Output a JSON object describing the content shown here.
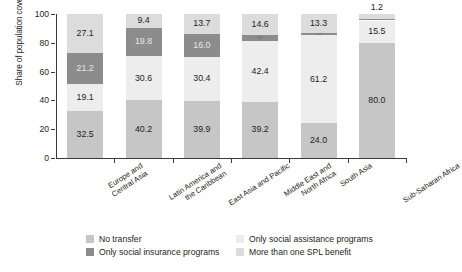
{
  "chart_data": {
    "type": "bar",
    "subtype": "stacked-bar-100",
    "title": "",
    "xlabel": "",
    "ylabel": "Share of population covered (%)",
    "ylim": [
      0,
      100
    ],
    "yticks": [
      0,
      20,
      40,
      60,
      80,
      100
    ],
    "grid": false,
    "legend_position": "bottom",
    "categories": [
      "Europe and\nCentral Asia",
      "Latin America and\nthe Caribbean",
      "East Asia and Pacific",
      "Middle East and\nNorth Africa",
      "South Asia",
      "Sub-Saharan Africa"
    ],
    "category_lines": [
      [
        "Europe and",
        "Central Asia"
      ],
      [
        "Latin America and",
        "the Caribbean"
      ],
      [
        "East Asia and Pacific"
      ],
      [
        "Middle East and",
        "North Africa"
      ],
      [
        "South Asia"
      ],
      [
        "Sub-Saharan Africa"
      ]
    ],
    "series": [
      {
        "name": "No transfer",
        "color": "#c6c6c6",
        "label_color": "dark",
        "values": [
          32.5,
          40.2,
          39.9,
          39.2,
          24.0,
          80.0
        ]
      },
      {
        "name": "Only social assistance programs",
        "color": "#ededed",
        "label_color": "dark",
        "values": [
          19.1,
          30.6,
          30.4,
          42.4,
          61.2,
          15.5
        ]
      },
      {
        "name": "Only social insurance programs",
        "color": "#8c8c8c",
        "label_color": "light",
        "values": [
          21.2,
          19.8,
          16.0,
          3.8,
          1.5,
          1.2
        ]
      },
      {
        "name": "More than one SPL benefit",
        "color": "#dcdcdc",
        "label_color": "dark",
        "values": [
          27.1,
          9.4,
          13.7,
          14.6,
          13.3,
          3.3
        ]
      }
    ],
    "stack_order_bottom_to_top": [
      "No transfer",
      "Only social assistance programs",
      "Only social insurance programs",
      "More than one SPL benefit"
    ],
    "bars": [
      {
        "category": "Europe and Central Asia",
        "segments": [
          {
            "series": "No transfer",
            "value": 32.5,
            "label": "32.5",
            "label_shown": true,
            "label_placement": "inside"
          },
          {
            "series": "Only social assistance programs",
            "value": 19.1,
            "label": "19.1",
            "label_shown": true,
            "label_placement": "inside"
          },
          {
            "series": "Only social insurance programs",
            "value": 21.2,
            "label": "21.2",
            "label_shown": true,
            "label_placement": "inside"
          },
          {
            "series": "More than one SPL benefit",
            "value": 27.1,
            "label": "27.1",
            "label_shown": true,
            "label_placement": "inside"
          }
        ]
      },
      {
        "category": "Latin America and the Caribbean",
        "segments": [
          {
            "series": "No transfer",
            "value": 40.2,
            "label": "40.2",
            "label_shown": true,
            "label_placement": "inside"
          },
          {
            "series": "Only social assistance programs",
            "value": 30.6,
            "label": "30.6",
            "label_shown": true,
            "label_placement": "inside"
          },
          {
            "series": "Only social insurance programs",
            "value": 19.8,
            "label": "19.8",
            "label_shown": true,
            "label_placement": "inside"
          },
          {
            "series": "More than one SPL benefit",
            "value": 9.4,
            "label": "9.4",
            "label_shown": true,
            "label_placement": "inside"
          }
        ]
      },
      {
        "category": "East Asia and Pacific",
        "segments": [
          {
            "series": "No transfer",
            "value": 39.9,
            "label": "39.9",
            "label_shown": true,
            "label_placement": "inside"
          },
          {
            "series": "Only social assistance programs",
            "value": 30.4,
            "label": "30.4",
            "label_shown": true,
            "label_placement": "inside"
          },
          {
            "series": "Only social insurance programs",
            "value": 16.0,
            "label": "16.0",
            "label_shown": true,
            "label_placement": "inside"
          },
          {
            "series": "More than one SPL benefit",
            "value": 13.7,
            "label": "13.7",
            "label_shown": true,
            "label_placement": "inside"
          }
        ]
      },
      {
        "category": "Middle East and North Africa",
        "segments": [
          {
            "series": "No transfer",
            "value": 39.2,
            "label": "39.2",
            "label_shown": true,
            "label_placement": "inside"
          },
          {
            "series": "Only social assistance programs",
            "value": 42.4,
            "label": "42.4",
            "label_shown": true,
            "label_placement": "inside"
          },
          {
            "series": "Only social insurance programs",
            "value": 3.8,
            "label": "3.8",
            "label_shown": true,
            "label_placement": "inside-tiny"
          },
          {
            "series": "More than one SPL benefit",
            "value": 14.6,
            "label": "14.6",
            "label_shown": true,
            "label_placement": "inside"
          }
        ]
      },
      {
        "category": "South Asia",
        "segments": [
          {
            "series": "No transfer",
            "value": 24.0,
            "label": "24.0",
            "label_shown": true,
            "label_placement": "inside"
          },
          {
            "series": "Only social assistance programs",
            "value": 61.2,
            "label": "61.2",
            "label_shown": true,
            "label_placement": "inside"
          },
          {
            "series": "Only social insurance programs",
            "value": 1.5,
            "label": "1.5",
            "label_shown": true,
            "label_placement": "inside-tiny"
          },
          {
            "series": "More than one SPL benefit",
            "value": 13.3,
            "label": "13.3",
            "label_shown": true,
            "label_placement": "inside"
          }
        ]
      },
      {
        "category": "Sub-Saharan Africa",
        "segments": [
          {
            "series": "No transfer",
            "value": 80.0,
            "label": "80.0",
            "label_shown": true,
            "label_placement": "inside"
          },
          {
            "series": "Only social assistance programs",
            "value": 15.5,
            "label": "15.5",
            "label_shown": true,
            "label_placement": "inside"
          },
          {
            "series": "Only social insurance programs",
            "value": 1.2,
            "label": "1.2",
            "label_shown": true,
            "label_placement": "inside-tiny"
          },
          {
            "series": "More than one SPL benefit",
            "value": 3.3,
            "label": "1.2",
            "label_shown": true,
            "label_placement": "above"
          }
        ]
      }
    ]
  },
  "legend": {
    "items": [
      {
        "label": "No transfer",
        "color": "#c6c6c6"
      },
      {
        "label": "Only social assistance programs",
        "color": "#ededed"
      },
      {
        "label": "Only social insurance programs",
        "color": "#8c8c8c"
      },
      {
        "label": "More than one SPL benefit",
        "color": "#dcdcdc"
      }
    ]
  }
}
